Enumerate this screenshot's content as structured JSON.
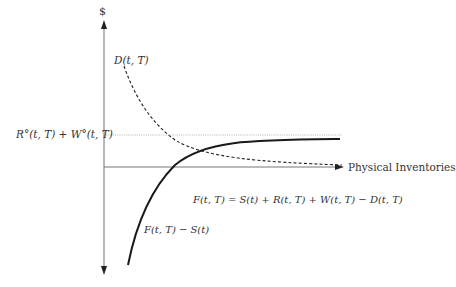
{
  "diagram": {
    "y_axis_label": "$",
    "x_axis_label": "Physical Inventories",
    "dashed_curve_label": "D(t, T)",
    "reference_line_label": "R°(t, T) + W°(t, T)",
    "equation_label": "F(t, T) = S(t) + R(t, T) + W(t, T) − D(t, T)",
    "solid_curve_label": "F(t, T) − S(t)",
    "colors": {
      "axis": "#777777",
      "solid_curve": "#1a1a1a",
      "dashed_curve": "#222222",
      "reference_line": "#b0b0b0",
      "text": "#333333"
    }
  }
}
